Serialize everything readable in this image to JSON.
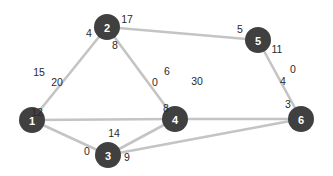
{
  "diagram": {
    "type": "weighted-graph",
    "colors": {
      "node": "#404040",
      "node_text": "#ffffff",
      "edge": "#c4c4c4",
      "weight_text": "#2a2a2a"
    },
    "nodes": [
      {
        "id": "1",
        "label": "1",
        "x": 32,
        "y": 120
      },
      {
        "id": "2",
        "label": "2",
        "x": 107,
        "y": 27
      },
      {
        "id": "3",
        "label": "3",
        "x": 108,
        "y": 155
      },
      {
        "id": "4",
        "label": "4",
        "x": 175,
        "y": 119
      },
      {
        "id": "5",
        "label": "5",
        "x": 258,
        "y": 40
      },
      {
        "id": "6",
        "label": "6",
        "x": 301,
        "y": 119
      }
    ],
    "edges": [
      {
        "from": "1",
        "to": "2"
      },
      {
        "from": "1",
        "to": "4"
      },
      {
        "from": "1",
        "to": "3"
      },
      {
        "from": "2",
        "to": "4"
      },
      {
        "from": "2",
        "to": "5"
      },
      {
        "from": "3",
        "to": "4"
      },
      {
        "from": "3",
        "to": "6"
      },
      {
        "from": "4",
        "to": "6"
      },
      {
        "from": "5",
        "to": "6"
      }
    ],
    "weights": [
      {
        "text": "15",
        "x": 39,
        "y": 72
      },
      {
        "text": "20",
        "x": 57,
        "y": 82
      },
      {
        "text": "12",
        "x": 37,
        "y": 112
      },
      {
        "text": "4",
        "x": 89,
        "y": 33
      },
      {
        "text": "17",
        "x": 127,
        "y": 19
      },
      {
        "text": "8",
        "x": 115,
        "y": 45
      },
      {
        "text": "0",
        "x": 87,
        "y": 151
      },
      {
        "text": "14",
        "x": 114,
        "y": 133
      },
      {
        "text": "9",
        "x": 127,
        "y": 157
      },
      {
        "text": "0",
        "x": 155,
        "y": 82
      },
      {
        "text": "6",
        "x": 167,
        "y": 71
      },
      {
        "text": "30",
        "x": 197,
        "y": 81
      },
      {
        "text": "8",
        "x": 166,
        "y": 108
      },
      {
        "text": "5",
        "x": 240,
        "y": 29
      },
      {
        "text": "11",
        "x": 277,
        "y": 49
      },
      {
        "text": "0",
        "x": 293,
        "y": 69
      },
      {
        "text": "4",
        "x": 283,
        "y": 81
      },
      {
        "text": "3",
        "x": 288,
        "y": 104
      }
    ]
  }
}
